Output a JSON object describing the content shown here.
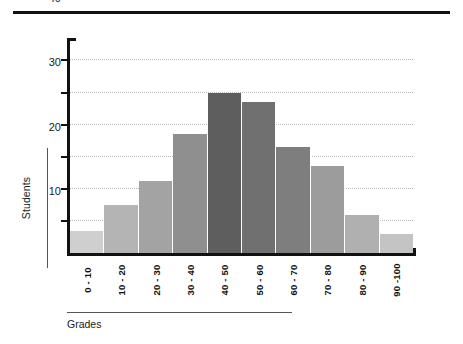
{
  "chart_data": {
    "type": "bar",
    "title": "",
    "subtitle": "",
    "xlabel": "Grades",
    "ylabel": "Students",
    "categories": [
      "0 - 10",
      "10 - 20",
      "20 - 30",
      "30 - 40",
      "40 - 50",
      "50 - 60",
      "60 - 70",
      "70 - 80",
      "80 - 90",
      "90 -100"
    ],
    "values": [
      7,
      15,
      22.5,
      37,
      50,
      47,
      33,
      27,
      12,
      6
    ],
    "bar_colors": [
      "#cfcfcf",
      "#b4b4b4",
      "#a3a3a3",
      "#8f8f8f",
      "#5e5e5e",
      "#707070",
      "#7e7e7e",
      "#9c9c9c",
      "#b0b0b0",
      "#c4c4c4"
    ],
    "ylim": [
      0,
      67
    ],
    "xlim_note": "categorical, 10 equal bins",
    "y_ticks": [
      0,
      10,
      20,
      30,
      40,
      50,
      60
    ],
    "y_tick_labels": [
      "0",
      "10",
      "20",
      "30",
      "40",
      "50",
      "60"
    ],
    "grid": "horizontal dotted gridlines at 10, 20, 30, 40, 50, 60",
    "legend": "none",
    "legend_position": "none",
    "xtick_rotation": "90 degrees (bottom-to-top)",
    "axis_color": "#111111",
    "gridline_color": "#b9b9b9"
  },
  "figure": {
    "top_rule": "",
    "y_axis_title": "Students",
    "x_axis_title": "Grades"
  }
}
